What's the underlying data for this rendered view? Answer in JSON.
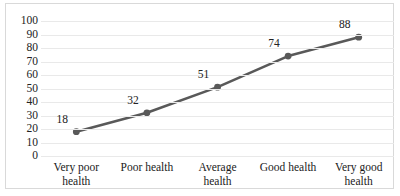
{
  "chart_data": {
    "type": "line",
    "title": "",
    "subtitle": "",
    "xlabel": "",
    "ylabel": "",
    "categories": [
      "Very poor health",
      "Poor health",
      "Average health",
      "Good health",
      "Very good health"
    ],
    "category_lines": [
      [
        "Very poor",
        "health"
      ],
      [
        "Poor health",
        ""
      ],
      [
        "Average",
        "health"
      ],
      [
        "Good health",
        ""
      ],
      [
        "Very good",
        "health"
      ]
    ],
    "values": [
      18,
      32,
      51,
      74,
      88
    ],
    "point_labels": [
      "18",
      "32",
      "51",
      "74",
      "88"
    ],
    "ylim": [
      0,
      100
    ],
    "ytick_step": 10,
    "yticks": [
      "100",
      "90",
      "80",
      "70",
      "60",
      "50",
      "40",
      "30",
      "20",
      "10",
      "0"
    ],
    "grid": "horizontal",
    "legend": "none",
    "series": [
      {
        "name": "",
        "values": [
          18,
          32,
          51,
          74,
          88
        ]
      }
    ]
  },
  "style": {
    "line_color": "#595959",
    "marker_color": "#595959",
    "grid_color": "#e9e9e9",
    "border_color": "#d9d9d9",
    "text_color": "#222222",
    "background": "#ffffff"
  },
  "artifact": {
    "top_strip_text": "............"
  }
}
